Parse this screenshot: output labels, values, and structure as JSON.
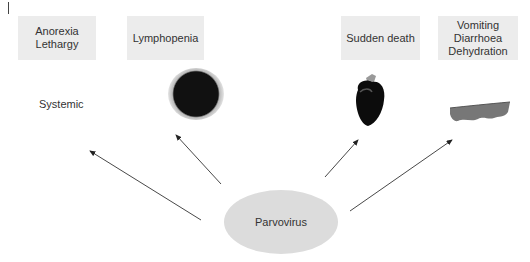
{
  "diagram": {
    "center": {
      "label": "Parvovirus"
    },
    "effects": [
      {
        "label": "Anorexia\nLethargy",
        "category": "Systemic",
        "image": "none"
      },
      {
        "label": "Lymphopenia",
        "image": "lymphocyte-cell"
      },
      {
        "label": "Sudden death",
        "image": "heart"
      },
      {
        "label": "Vomiting\nDiarrhoea\nDehydration",
        "image": "intestine-section"
      }
    ],
    "side_label": "Systemic",
    "colors": {
      "box_fill": "#ececec",
      "ellipse_fill": "#dcdcdc",
      "arrow": "#333333",
      "text": "#333333"
    }
  }
}
